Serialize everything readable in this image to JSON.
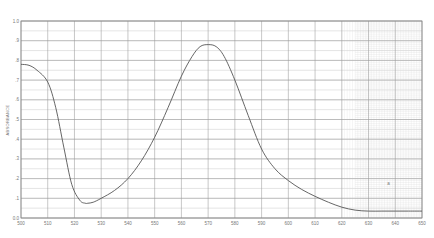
{
  "chart_data": {
    "type": "line",
    "title": "",
    "xlabel": "",
    "ylabel": "ABSORBANCE",
    "xlim": [
      500,
      650
    ],
    "ylim": [
      0.0,
      1.0
    ],
    "grid": true,
    "legend": null,
    "x_ticks": [
      "500",
      "510",
      "520",
      "530",
      "540",
      "550",
      "560",
      "570",
      "580",
      "590",
      "600",
      "610",
      "620",
      "630",
      "640",
      "650"
    ],
    "y_ticks": [
      "0.0",
      ".1",
      ".2",
      ".3",
      ".4",
      ".5",
      ".6",
      ".7",
      ".8",
      ".9",
      "1.0"
    ],
    "annotations": [
      {
        "text": "a",
        "x": 637,
        "y": 0.17
      }
    ],
    "series": [
      {
        "name": "absorbance",
        "color": "#555555",
        "x": [
          500,
          503,
          506,
          510,
          513,
          516,
          519,
          522,
          524,
          525,
          527,
          530,
          535,
          540,
          545,
          550,
          555,
          560,
          564,
          567,
          570,
          573,
          576,
          580,
          585,
          590,
          595,
          600,
          605,
          610,
          615,
          620,
          625,
          630,
          635,
          640,
          645,
          650
        ],
        "values": [
          0.78,
          0.775,
          0.75,
          0.69,
          0.56,
          0.36,
          0.17,
          0.09,
          0.075,
          0.075,
          0.08,
          0.1,
          0.14,
          0.2,
          0.29,
          0.41,
          0.56,
          0.72,
          0.82,
          0.87,
          0.88,
          0.87,
          0.82,
          0.7,
          0.52,
          0.35,
          0.25,
          0.19,
          0.145,
          0.11,
          0.08,
          0.055,
          0.04,
          0.035,
          0.035,
          0.035,
          0.035,
          0.035
        ]
      }
    ]
  }
}
